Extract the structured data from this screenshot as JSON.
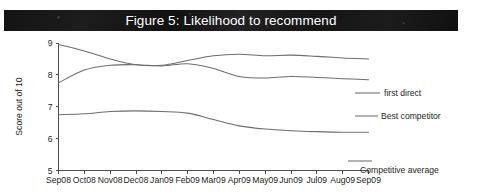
{
  "figure": {
    "title": "Figure 5: Likelihood to recommend",
    "banner_color": "#141414",
    "title_color": "#ffffff",
    "line_color": "#6d6d6d",
    "axis_color": "#4d4d4d"
  },
  "chart_data": {
    "type": "line",
    "title": "Figure 5: Likelihood to recommend",
    "xlabel": "",
    "ylabel": "Score out of 10",
    "ylim": [
      5,
      9
    ],
    "yticks": [
      5,
      6,
      7,
      8,
      9
    ],
    "grid": false,
    "legend_position": "right-inline",
    "categories": [
      "Sep08",
      "Oct08",
      "Nov08",
      "Dec08",
      "Jan09",
      "Feb09",
      "Mar09",
      "Apr09",
      "May09",
      "Jun09",
      "Jul09",
      "Aug09",
      "Sep09"
    ],
    "series": [
      {
        "name": "first direct",
        "values": [
          8.95,
          8.75,
          8.5,
          8.32,
          8.3,
          8.45,
          8.6,
          8.65,
          8.6,
          8.62,
          8.58,
          8.53,
          8.5
        ]
      },
      {
        "name": "Best competitor",
        "values": [
          7.75,
          8.15,
          8.3,
          8.32,
          8.28,
          8.35,
          8.2,
          7.95,
          7.9,
          7.95,
          7.92,
          7.88,
          7.85
        ]
      },
      {
        "name": "Competitive average",
        "values": [
          6.75,
          6.78,
          6.85,
          6.87,
          6.85,
          6.8,
          6.6,
          6.4,
          6.3,
          6.25,
          6.22,
          6.2,
          6.2
        ]
      }
    ],
    "annotations": [
      {
        "text": "first direct",
        "near": "Sep09"
      },
      {
        "text": "Best competitor",
        "near": "Sep09"
      },
      {
        "text": "Competitive average",
        "near": "Sep09"
      }
    ]
  }
}
